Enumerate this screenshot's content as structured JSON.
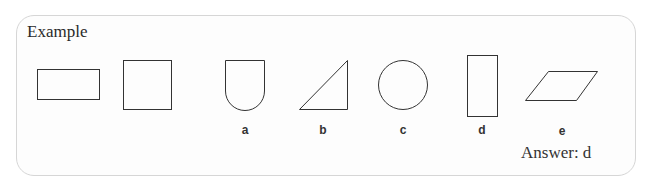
{
  "title": "Example",
  "shapes": {
    "given": [
      "rectangle",
      "square"
    ],
    "options": [
      {
        "label": "a",
        "shape": "shield"
      },
      {
        "label": "b",
        "shape": "right-triangle"
      },
      {
        "label": "c",
        "shape": "circle"
      },
      {
        "label": "d",
        "shape": "tall-rectangle"
      },
      {
        "label": "e",
        "shape": "parallelogram"
      }
    ]
  },
  "answer": "Answer: d",
  "colors": {
    "stroke": "#333333",
    "border": "#d6d6d6"
  }
}
